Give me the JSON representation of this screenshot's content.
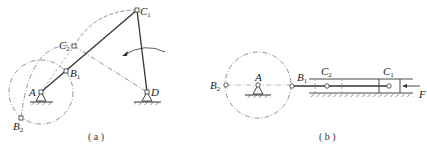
{
  "panel_a": {
    "caption": "( a )",
    "points": {
      "A": {
        "label": "A",
        "x": 41,
        "y": 92
      },
      "B1": {
        "label": "B",
        "sub": "1",
        "x": 66,
        "y": 71
      },
      "B2": {
        "label": "B",
        "sub": "2",
        "x": 21,
        "y": 118
      },
      "C1": {
        "label": "C",
        "sub": "1",
        "x": 137,
        "y": 10
      },
      "C2": {
        "label": "C",
        "sub": "2",
        "x": 74,
        "y": 46
      },
      "D": {
        "label": "D",
        "x": 147,
        "y": 92
      }
    }
  },
  "panel_b": {
    "caption": "( b )",
    "points": {
      "A": {
        "label": "A",
        "x": 258,
        "y": 85
      },
      "B1": {
        "label": "B",
        "sub": "1",
        "x": 292,
        "y": 86
      },
      "B2": {
        "label": "B",
        "sub": "2",
        "x": 226,
        "y": 85
      },
      "C1": {
        "label": "C",
        "sub": "1",
        "x": 389,
        "y": 86
      },
      "C2": {
        "label": "C",
        "sub": "2",
        "x": 327,
        "y": 86
      }
    },
    "force_label": "F"
  },
  "colors": {
    "line": "#333333",
    "dash": "#777777"
  }
}
